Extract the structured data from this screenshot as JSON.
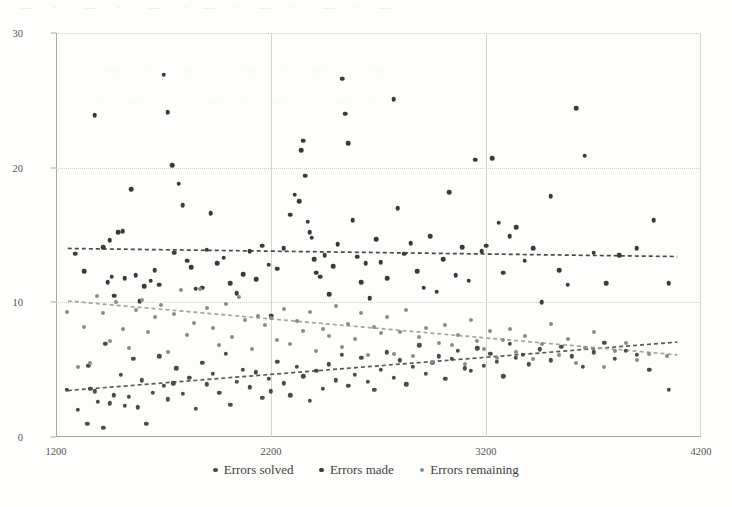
{
  "chart_data": {
    "type": "scatter",
    "title": "",
    "xlabel": "",
    "ylabel": "",
    "xlim": [
      1200,
      4200
    ],
    "ylim": [
      0,
      30
    ],
    "xticks": [
      "1200",
      "2200",
      "3200",
      "4200"
    ],
    "xtick_values": [
      1200,
      2200,
      3200,
      4200
    ],
    "yticks": [
      "0",
      "10",
      "20",
      "30"
    ],
    "ytick_values": [
      0,
      10,
      20,
      30
    ],
    "grid": "both",
    "legend_position": "bottom-center",
    "colors": {
      "errors_solved": "#4d4c4a",
      "errors_made": "#3b3a39",
      "errors_remaining": "#8d8c89",
      "axis": "#a9a8a4",
      "grid": "#cfcecb",
      "text": "#3f3e3c",
      "background": "#fdfdfc"
    },
    "series": [
      {
        "name": "Errors solved",
        "color": "#4d4c4a",
        "marker": "circle",
        "trendline": {
          "style": "dashed",
          "color": "#5a5957",
          "x0": 1255,
          "y0": 3.45,
          "x1": 4090,
          "y1": 7.05
        },
        "points": [
          [
            1250,
            3.5
          ],
          [
            1300,
            2.0
          ],
          [
            1345,
            1.0
          ],
          [
            1350,
            5.3
          ],
          [
            1360,
            3.6
          ],
          [
            1380,
            3.4
          ],
          [
            1395,
            2.6
          ],
          [
            1420,
            0.7
          ],
          [
            1430,
            6.9
          ],
          [
            1450,
            2.5
          ],
          [
            1470,
            3.1
          ],
          [
            1500,
            4.6
          ],
          [
            1520,
            2.3
          ],
          [
            1540,
            3.0
          ],
          [
            1560,
            5.8
          ],
          [
            1580,
            2.2
          ],
          [
            1600,
            4.2
          ],
          [
            1620,
            1.0
          ],
          [
            1650,
            3.3
          ],
          [
            1680,
            6.0
          ],
          [
            1700,
            3.8
          ],
          [
            1720,
            2.8
          ],
          [
            1745,
            4.0
          ],
          [
            1760,
            5.1
          ],
          [
            1790,
            3.2
          ],
          [
            1820,
            4.4
          ],
          [
            1850,
            2.1
          ],
          [
            1880,
            5.5
          ],
          [
            1900,
            3.9
          ],
          [
            1930,
            4.7
          ],
          [
            1960,
            3.3
          ],
          [
            1990,
            6.2
          ],
          [
            2010,
            2.4
          ],
          [
            2040,
            4.1
          ],
          [
            2070,
            5.0
          ],
          [
            2100,
            3.7
          ],
          [
            2130,
            4.8
          ],
          [
            2160,
            2.9
          ],
          [
            2190,
            4.3
          ],
          [
            2200,
            3.4
          ],
          [
            2230,
            5.6
          ],
          [
            2260,
            4.0
          ],
          [
            2290,
            3.1
          ],
          [
            2320,
            5.2
          ],
          [
            2350,
            4.5
          ],
          [
            2380,
            2.7
          ],
          [
            2410,
            4.9
          ],
          [
            2440,
            3.6
          ],
          [
            2470,
            5.4
          ],
          [
            2500,
            4.2
          ],
          [
            2530,
            6.1
          ],
          [
            2560,
            3.8
          ],
          [
            2590,
            4.6
          ],
          [
            2620,
            5.9
          ],
          [
            2650,
            4.1
          ],
          [
            2680,
            3.5
          ],
          [
            2710,
            5.0
          ],
          [
            2740,
            6.3
          ],
          [
            2770,
            4.4
          ],
          [
            2800,
            5.7
          ],
          [
            2830,
            3.9
          ],
          [
            2860,
            5.2
          ],
          [
            2890,
            6.8
          ],
          [
            2920,
            4.7
          ],
          [
            2950,
            5.5
          ],
          [
            2980,
            6.0
          ],
          [
            3010,
            4.3
          ],
          [
            3040,
            5.8
          ],
          [
            3070,
            6.4
          ],
          [
            3100,
            5.1
          ],
          [
            3130,
            4.9
          ],
          [
            3160,
            6.6
          ],
          [
            3190,
            5.3
          ],
          [
            3220,
            6.2
          ],
          [
            3250,
            5.6
          ],
          [
            3280,
            4.5
          ],
          [
            3310,
            6.9
          ],
          [
            3340,
            5.9
          ],
          [
            3370,
            6.1
          ],
          [
            3400,
            5.4
          ],
          [
            3450,
            6.5
          ],
          [
            3500,
            5.7
          ],
          [
            3550,
            6.7
          ],
          [
            3600,
            6.0
          ],
          [
            3650,
            5.2
          ],
          [
            3700,
            6.3
          ],
          [
            3750,
            7.0
          ],
          [
            3800,
            5.8
          ],
          [
            3850,
            6.4
          ],
          [
            3900,
            6.1
          ],
          [
            3960,
            5.0
          ],
          [
            4050,
            3.5
          ]
        ]
      },
      {
        "name": "Errors made",
        "color": "#3b3a39",
        "marker": "circle",
        "trendline": {
          "style": "dashed",
          "color": "#4a4947",
          "x0": 1255,
          "y0": 14.0,
          "x1": 4090,
          "y1": 13.4
        },
        "points": [
          [
            1290,
            13.6
          ],
          [
            1330,
            12.3
          ],
          [
            1380,
            23.9
          ],
          [
            1420,
            14.1
          ],
          [
            1440,
            11.5
          ],
          [
            1450,
            14.6
          ],
          [
            1460,
            11.9
          ],
          [
            1470,
            10.5
          ],
          [
            1490,
            15.2
          ],
          [
            1510,
            15.3
          ],
          [
            1520,
            11.8
          ],
          [
            1550,
            18.4
          ],
          [
            1570,
            12.0
          ],
          [
            1590,
            10.1
          ],
          [
            1610,
            11.2
          ],
          [
            1640,
            11.6
          ],
          [
            1660,
            12.4
          ],
          [
            1680,
            11.3
          ],
          [
            1700,
            26.9
          ],
          [
            1720,
            24.1
          ],
          [
            1740,
            20.2
          ],
          [
            1750,
            13.7
          ],
          [
            1770,
            18.8
          ],
          [
            1790,
            17.2
          ],
          [
            1810,
            13.1
          ],
          [
            1830,
            12.6
          ],
          [
            1850,
            11.0
          ],
          [
            1880,
            11.1
          ],
          [
            1900,
            13.9
          ],
          [
            1920,
            16.6
          ],
          [
            1950,
            12.9
          ],
          [
            1980,
            13.3
          ],
          [
            2010,
            11.4
          ],
          [
            2040,
            10.7
          ],
          [
            2070,
            12.1
          ],
          [
            2100,
            13.8
          ],
          [
            2130,
            11.7
          ],
          [
            2160,
            14.2
          ],
          [
            2190,
            12.8
          ],
          [
            2200,
            9.0
          ],
          [
            2230,
            12.5
          ],
          [
            2260,
            14.0
          ],
          [
            2290,
            16.5
          ],
          [
            2310,
            18.0
          ],
          [
            2330,
            17.5
          ],
          [
            2340,
            21.3
          ],
          [
            2350,
            22.0
          ],
          [
            2360,
            19.4
          ],
          [
            2370,
            16.0
          ],
          [
            2380,
            15.2
          ],
          [
            2390,
            14.8
          ],
          [
            2400,
            13.2
          ],
          [
            2410,
            12.2
          ],
          [
            2430,
            11.9
          ],
          [
            2450,
            13.5
          ],
          [
            2470,
            10.6
          ],
          [
            2490,
            12.7
          ],
          [
            2510,
            14.3
          ],
          [
            2530,
            26.6
          ],
          [
            2545,
            24.0
          ],
          [
            2560,
            21.8
          ],
          [
            2580,
            16.1
          ],
          [
            2600,
            13.4
          ],
          [
            2620,
            11.5
          ],
          [
            2640,
            12.9
          ],
          [
            2660,
            10.3
          ],
          [
            2690,
            14.7
          ],
          [
            2710,
            13.0
          ],
          [
            2740,
            11.8
          ],
          [
            2770,
            25.1
          ],
          [
            2790,
            17.0
          ],
          [
            2820,
            13.6
          ],
          [
            2850,
            14.4
          ],
          [
            2880,
            12.3
          ],
          [
            2910,
            11.1
          ],
          [
            2940,
            14.9
          ],
          [
            2970,
            10.8
          ],
          [
            3000,
            13.2
          ],
          [
            3030,
            18.2
          ],
          [
            3060,
            12.0
          ],
          [
            3090,
            14.1
          ],
          [
            3120,
            11.6
          ],
          [
            3150,
            20.6
          ],
          [
            3180,
            13.8
          ],
          [
            3200,
            14.2
          ],
          [
            3230,
            20.7
          ],
          [
            3260,
            15.9
          ],
          [
            3280,
            12.2
          ],
          [
            3310,
            14.9
          ],
          [
            3340,
            15.6
          ],
          [
            3380,
            13.1
          ],
          [
            3420,
            14.0
          ],
          [
            3460,
            10.0
          ],
          [
            3500,
            17.9
          ],
          [
            3540,
            12.4
          ],
          [
            3580,
            11.3
          ],
          [
            3620,
            24.4
          ],
          [
            3660,
            20.9
          ],
          [
            3700,
            13.7
          ],
          [
            3760,
            11.4
          ],
          [
            3820,
            13.5
          ],
          [
            3900,
            14.0
          ],
          [
            3980,
            16.1
          ],
          [
            4050,
            11.4
          ]
        ]
      },
      {
        "name": "Errors remaining",
        "color": "#8d8c89",
        "marker": "circle",
        "trendline": {
          "style": "dashed",
          "color": "#a6a5a1",
          "x0": 1255,
          "y0": 10.1,
          "x1": 4090,
          "y1": 6.1
        },
        "points": [
          [
            1250,
            9.3
          ],
          [
            1300,
            5.2
          ],
          [
            1330,
            8.2
          ],
          [
            1360,
            5.5
          ],
          [
            1390,
            10.5
          ],
          [
            1420,
            9.2
          ],
          [
            1450,
            7.1
          ],
          [
            1480,
            10.0
          ],
          [
            1510,
            8.0
          ],
          [
            1540,
            6.6
          ],
          [
            1570,
            9.4
          ],
          [
            1600,
            10.2
          ],
          [
            1630,
            7.8
          ],
          [
            1660,
            8.9
          ],
          [
            1690,
            9.8
          ],
          [
            1720,
            6.3
          ],
          [
            1750,
            9.1
          ],
          [
            1780,
            10.9
          ],
          [
            1810,
            7.6
          ],
          [
            1840,
            8.5
          ],
          [
            1870,
            11.0
          ],
          [
            1900,
            9.6
          ],
          [
            1930,
            8.1
          ],
          [
            1960,
            6.8
          ],
          [
            1990,
            9.9
          ],
          [
            2020,
            7.4
          ],
          [
            2050,
            10.4
          ],
          [
            2080,
            8.7
          ],
          [
            2110,
            6.5
          ],
          [
            2140,
            9.0
          ],
          [
            2170,
            8.3
          ],
          [
            2200,
            8.8
          ],
          [
            2230,
            7.2
          ],
          [
            2260,
            9.5
          ],
          [
            2290,
            6.9
          ],
          [
            2320,
            8.6
          ],
          [
            2350,
            7.9
          ],
          [
            2380,
            9.3
          ],
          [
            2410,
            6.4
          ],
          [
            2440,
            8.0
          ],
          [
            2470,
            7.5
          ],
          [
            2500,
            9.7
          ],
          [
            2530,
            6.7
          ],
          [
            2560,
            8.4
          ],
          [
            2590,
            7.3
          ],
          [
            2620,
            9.2
          ],
          [
            2650,
            6.1
          ],
          [
            2680,
            8.2
          ],
          [
            2710,
            7.7
          ],
          [
            2740,
            8.9
          ],
          [
            2770,
            6.2
          ],
          [
            2800,
            7.8
          ],
          [
            2830,
            9.4
          ],
          [
            2860,
            6.0
          ],
          [
            2890,
            7.4
          ],
          [
            2920,
            8.1
          ],
          [
            2950,
            5.6
          ],
          [
            2980,
            7.0
          ],
          [
            3010,
            8.3
          ],
          [
            3040,
            6.8
          ],
          [
            3070,
            7.6
          ],
          [
            3100,
            5.4
          ],
          [
            3130,
            8.7
          ],
          [
            3160,
            7.1
          ],
          [
            3190,
            6.5
          ],
          [
            3220,
            7.9
          ],
          [
            3250,
            5.9
          ],
          [
            3280,
            7.2
          ],
          [
            3310,
            8.0
          ],
          [
            3340,
            6.3
          ],
          [
            3380,
            7.5
          ],
          [
            3420,
            5.8
          ],
          [
            3460,
            6.9
          ],
          [
            3500,
            8.4
          ],
          [
            3540,
            6.1
          ],
          [
            3580,
            7.3
          ],
          [
            3620,
            5.5
          ],
          [
            3660,
            6.6
          ],
          [
            3700,
            7.8
          ],
          [
            3750,
            5.2
          ],
          [
            3800,
            6.4
          ],
          [
            3850,
            7.0
          ],
          [
            3900,
            5.7
          ],
          [
            3960,
            6.2
          ],
          [
            4040,
            6.0
          ]
        ]
      }
    ]
  },
  "legend": {
    "items": [
      {
        "label": "Errors solved",
        "color": "#4d4c4a"
      },
      {
        "label": "Errors made",
        "color": "#3b3a39"
      },
      {
        "label": "Errors remaining",
        "color": "#8d8c89"
      }
    ]
  },
  "artifacts": {
    "top_bleed": "   —   ·     —   ·    —   ·  —    ·   —   ·    —   ·   —  ·",
    "mid_bleed_line1": "  —   ·    —  ·   —   ·   —  ·   —",
    "mid_bleed_line2": " ·   —   ·    —   ·   —   ·  —   ·"
  }
}
